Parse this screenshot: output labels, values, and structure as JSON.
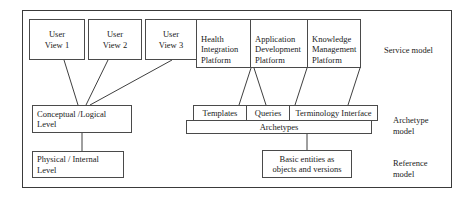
{
  "diagram": {
    "frame_label": "outer-frame",
    "colors": {
      "background": "#ffffff",
      "box_border": "#4a4a4a",
      "frame_border": "#3a3a3a",
      "connector": "#3f3f3f",
      "text": "#1a1a1a"
    },
    "user_views": [
      {
        "id": "user-view-1",
        "label": "User\nView 1"
      },
      {
        "id": "user-view-2",
        "label": "User\nView 2"
      },
      {
        "id": "user-view-3",
        "label": "User\nView 3"
      }
    ],
    "left_levels": [
      {
        "id": "conceptual-logical-level",
        "label": "Conceptual /Logical\nLevel"
      },
      {
        "id": "physical-internal-level",
        "label": "Physical / Internal\nLevel"
      }
    ],
    "platforms": [
      {
        "id": "health-integration-platform",
        "label": "Health\nIntegration\nPlatform"
      },
      {
        "id": "application-development-platform",
        "label": "Application\nDevelopment\nPlatform"
      },
      {
        "id": "knowledge-management-platform",
        "label": "Knowledge\nManagement\nPlatform"
      }
    ],
    "archetype_row": [
      {
        "id": "templates",
        "label": "Templates"
      },
      {
        "id": "queries",
        "label": "Queries"
      },
      {
        "id": "terminology-interface",
        "label": "Terminology Interface"
      }
    ],
    "archetypes_bar": {
      "id": "archetypes",
      "label": "Archetypes"
    },
    "reference_entities": {
      "id": "basic-entities",
      "label": "Basic entities as\nobjects and versions"
    },
    "model_labels": [
      {
        "id": "service-model-label",
        "label": "Service model"
      },
      {
        "id": "archetype-model-label",
        "label": "Archetype\nmodel"
      },
      {
        "id": "reference-model-label",
        "label": "Reference\nmodel"
      }
    ]
  }
}
